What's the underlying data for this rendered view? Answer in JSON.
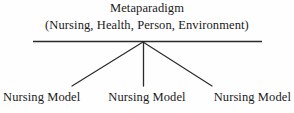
{
  "diagram": {
    "type": "hierarchy-tree",
    "root": {
      "title": "Metaparadigm",
      "concepts": "(Nursing, Health, Person, Environment)"
    },
    "children": [
      {
        "label": "Nursing Model"
      },
      {
        "label": "Nursing Model"
      },
      {
        "label": "Nursing Model"
      }
    ],
    "colors": {
      "stroke": "#2b2b2b",
      "text": "#1a1a1a",
      "background": "#fefefe"
    }
  }
}
